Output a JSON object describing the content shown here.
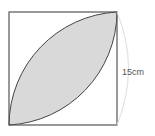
{
  "diagram": {
    "type": "geometry",
    "side_label": "15cm",
    "colors": {
      "square_stroke": "#555555",
      "lens_fill": "#d9d9d9",
      "arc_stroke": "#444444",
      "dimension_arc": "#dddddd",
      "label": "#555555"
    }
  }
}
